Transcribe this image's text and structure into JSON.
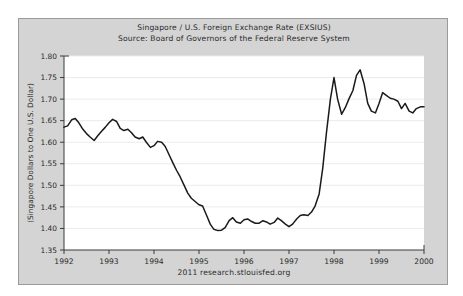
{
  "figure": {
    "title_line_1": "Singapore / U.S. Foreign Exchange Rate (EXSIUS)",
    "title_line_2": "Source: Board of Governors of the Federal Reserve System",
    "footer": "2011 research.stlouisfed.org",
    "panel_color": "#d4d4d4",
    "plot_color": "#ffffff",
    "line_color": "#1a1a1a",
    "grid_color": "#ebebeb",
    "axis_color": "#3a3a3a"
  },
  "chart_data": {
    "type": "line",
    "title": "Singapore / U.S. Foreign Exchange Rate (EXSIUS)",
    "subtitle": "Source: Board of Governors of the Federal Reserve System",
    "xlabel": "",
    "ylabel": "(Singapore Dollars to One U.S. Dollar)",
    "xlim": [
      1992.0,
      2000.0
    ],
    "ylim": [
      1.35,
      1.8
    ],
    "grid": true,
    "legend": "none",
    "xticks": [
      "1992",
      "1993",
      "1994",
      "1995",
      "1996",
      "1997",
      "1998",
      "1999",
      "2000"
    ],
    "xtick_values": [
      1992,
      1993,
      1994,
      1995,
      1996,
      1997,
      1998,
      1999,
      2000
    ],
    "yticks": [
      "1.35",
      "1.40",
      "1.45",
      "1.50",
      "1.55",
      "1.60",
      "1.65",
      "1.70",
      "1.75",
      "1.80"
    ],
    "ytick_values": [
      1.35,
      1.4,
      1.45,
      1.5,
      1.55,
      1.6,
      1.65,
      1.7,
      1.75,
      1.8
    ],
    "series": [
      {
        "name": "EXSIUS",
        "x": [
          1992.0,
          1992.08,
          1992.17,
          1992.25,
          1992.33,
          1992.42,
          1992.5,
          1992.58,
          1992.67,
          1992.75,
          1992.83,
          1992.92,
          1993.0,
          1993.08,
          1993.17,
          1993.25,
          1993.33,
          1993.42,
          1993.5,
          1993.58,
          1993.67,
          1993.75,
          1993.83,
          1993.92,
          1994.0,
          1994.08,
          1994.17,
          1994.25,
          1994.33,
          1994.42,
          1994.5,
          1994.58,
          1994.67,
          1994.75,
          1994.83,
          1994.92,
          1995.0,
          1995.08,
          1995.17,
          1995.25,
          1995.33,
          1995.42,
          1995.5,
          1995.58,
          1995.67,
          1995.75,
          1995.83,
          1995.92,
          1996.0,
          1996.08,
          1996.17,
          1996.25,
          1996.33,
          1996.42,
          1996.5,
          1996.58,
          1996.67,
          1996.75,
          1996.83,
          1996.92,
          1997.0,
          1997.08,
          1997.17,
          1997.25,
          1997.33,
          1997.42,
          1997.5,
          1997.58,
          1997.67,
          1997.75,
          1997.83,
          1997.92,
          1998.0,
          1998.08,
          1998.17,
          1998.25,
          1998.33,
          1998.42,
          1998.5,
          1998.58,
          1998.67,
          1998.75,
          1998.83,
          1998.92,
          1999.0,
          1999.08,
          1999.17,
          1999.25,
          1999.33,
          1999.42,
          1999.5,
          1999.58,
          1999.67,
          1999.75,
          1999.83,
          1999.92,
          2000.0
        ],
        "values": [
          1.635,
          1.638,
          1.652,
          1.655,
          1.645,
          1.63,
          1.62,
          1.612,
          1.604,
          1.615,
          1.625,
          1.635,
          1.645,
          1.653,
          1.648,
          1.632,
          1.627,
          1.63,
          1.622,
          1.612,
          1.608,
          1.612,
          1.6,
          1.588,
          1.592,
          1.602,
          1.6,
          1.59,
          1.572,
          1.552,
          1.535,
          1.52,
          1.5,
          1.482,
          1.47,
          1.462,
          1.455,
          1.452,
          1.43,
          1.41,
          1.398,
          1.395,
          1.396,
          1.402,
          1.418,
          1.425,
          1.415,
          1.412,
          1.42,
          1.422,
          1.416,
          1.412,
          1.412,
          1.418,
          1.415,
          1.41,
          1.414,
          1.424,
          1.418,
          1.41,
          1.404,
          1.41,
          1.422,
          1.43,
          1.432,
          1.43,
          1.438,
          1.452,
          1.48,
          1.54,
          1.62,
          1.7,
          1.75,
          1.7,
          1.665,
          1.68,
          1.7,
          1.72,
          1.755,
          1.768,
          1.735,
          1.69,
          1.672,
          1.668,
          1.69,
          1.715,
          1.708,
          1.702,
          1.7,
          1.695,
          1.678,
          1.69,
          1.672,
          1.668,
          1.678,
          1.682,
          1.682
        ]
      }
    ]
  }
}
